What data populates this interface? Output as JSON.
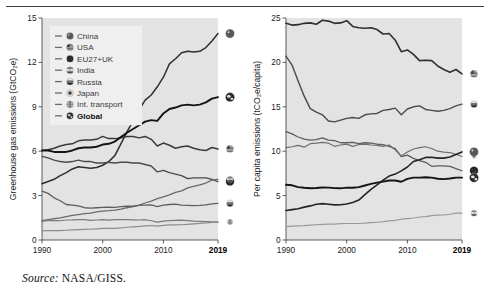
{
  "figure": {
    "source_prefix": "Source:",
    "source_text": "NASA/GISS."
  },
  "palette": {
    "plot_bg": "#e3e3e3",
    "legend_bg": "#efefef",
    "axis": "#4a4a4a",
    "line_dark": "#2f2f2f",
    "line_mid": "#5a5a5a",
    "line_light": "#8e8e8e",
    "global": "#1a1a1a"
  },
  "chart_data": [
    {
      "type": "line",
      "id": "left",
      "title": "",
      "ylabel": "Greenhouse gas emissions (GtCO₂e)",
      "xlabel": "",
      "xlim": [
        1990,
        2019
      ],
      "ylim": [
        0,
        15
      ],
      "yticks": [
        0,
        3,
        6,
        9,
        12,
        15
      ],
      "xticks": [
        1990,
        2000,
        2010,
        2019
      ],
      "xtick_labels": [
        "1990",
        "2000",
        "2010",
        "2019"
      ],
      "xtick_bold_last": true,
      "grid": false,
      "legend_position": "top-left",
      "x": [
        1990,
        1991,
        1992,
        1993,
        1994,
        1995,
        1996,
        1997,
        1998,
        1999,
        2000,
        2001,
        2002,
        2003,
        2004,
        2005,
        2006,
        2007,
        2008,
        2009,
        2010,
        2011,
        2012,
        2013,
        2014,
        2015,
        2016,
        2017,
        2018,
        2019
      ],
      "series": [
        {
          "name": "China",
          "marker": "china-flag-icon",
          "width": 1.5,
          "color": "#2f2f2f",
          "values": [
            3.8,
            3.95,
            4.1,
            4.35,
            4.55,
            4.8,
            4.95,
            4.9,
            4.85,
            4.9,
            5.05,
            5.3,
            5.7,
            6.5,
            7.3,
            8.05,
            8.8,
            9.45,
            9.8,
            10.35,
            11.0,
            11.9,
            12.25,
            12.65,
            12.75,
            12.7,
            12.75,
            13.0,
            13.45,
            13.95
          ]
        },
        {
          "name": "USA",
          "marker": "usa-flag-icon",
          "width": 1.5,
          "color": "#3a3a3a",
          "values": [
            6.05,
            6.1,
            6.2,
            6.35,
            6.45,
            6.5,
            6.7,
            6.75,
            6.75,
            6.8,
            7.0,
            6.85,
            6.85,
            6.9,
            7.0,
            7.0,
            6.9,
            7.0,
            6.8,
            6.35,
            6.55,
            6.4,
            6.2,
            6.3,
            6.35,
            6.2,
            6.1,
            6.05,
            6.25,
            6.15
          ]
        },
        {
          "name": "EU27+UK",
          "marker": "eu-flag-icon",
          "width": 1.4,
          "color": "#4a4a4a",
          "values": [
            5.65,
            5.55,
            5.4,
            5.3,
            5.25,
            5.3,
            5.4,
            5.3,
            5.3,
            5.2,
            5.2,
            5.25,
            5.2,
            5.25,
            5.25,
            5.2,
            5.2,
            5.1,
            5.0,
            4.6,
            4.7,
            4.55,
            4.45,
            4.35,
            4.15,
            4.2,
            4.2,
            4.2,
            4.1,
            3.95
          ]
        },
        {
          "name": "India",
          "marker": "india-flag-icon",
          "width": 1.3,
          "color": "#6a6a6a",
          "values": [
            1.3,
            1.38,
            1.45,
            1.5,
            1.58,
            1.66,
            1.72,
            1.78,
            1.82,
            1.9,
            1.95,
            1.98,
            2.02,
            2.08,
            2.18,
            2.26,
            2.36,
            2.5,
            2.62,
            2.8,
            2.92,
            3.05,
            3.22,
            3.32,
            3.52,
            3.62,
            3.72,
            3.85,
            4.05,
            4.1
          ]
        },
        {
          "name": "Russia",
          "marker": "russia-flag-icon",
          "width": 1.3,
          "color": "#5f5f5f",
          "values": [
            3.3,
            3.15,
            2.85,
            2.65,
            2.4,
            2.35,
            2.3,
            2.18,
            2.15,
            2.18,
            2.2,
            2.22,
            2.2,
            2.26,
            2.28,
            2.28,
            2.34,
            2.36,
            2.38,
            2.26,
            2.36,
            2.4,
            2.42,
            2.36,
            2.34,
            2.32,
            2.34,
            2.38,
            2.44,
            2.48
          ]
        },
        {
          "name": "Japan",
          "marker": "japan-flag-icon",
          "width": 1.2,
          "color": "#7a7a7a",
          "values": [
            1.28,
            1.3,
            1.32,
            1.3,
            1.35,
            1.36,
            1.38,
            1.37,
            1.33,
            1.35,
            1.37,
            1.34,
            1.37,
            1.38,
            1.37,
            1.36,
            1.35,
            1.37,
            1.3,
            1.21,
            1.27,
            1.31,
            1.33,
            1.34,
            1.31,
            1.27,
            1.26,
            1.25,
            1.22,
            1.19
          ]
        },
        {
          "name": "Int. transport",
          "marker": "transport-icon",
          "width": 1.2,
          "color": "#8c8c8c",
          "values": [
            0.62,
            0.63,
            0.64,
            0.64,
            0.66,
            0.68,
            0.7,
            0.72,
            0.73,
            0.75,
            0.78,
            0.78,
            0.79,
            0.82,
            0.86,
            0.89,
            0.92,
            0.96,
            0.98,
            0.94,
            0.99,
            1.02,
            1.02,
            1.03,
            1.06,
            1.09,
            1.12,
            1.16,
            1.19,
            1.22
          ]
        },
        {
          "name": "Global",
          "marker": "globe-icon",
          "width": 1.9,
          "color": "#141414",
          "values": [
            6.05,
            6.05,
            5.95,
            5.95,
            5.95,
            6.05,
            6.2,
            6.25,
            6.25,
            6.3,
            6.45,
            6.5,
            6.65,
            6.95,
            7.25,
            7.5,
            7.75,
            8.0,
            8.1,
            8.05,
            8.55,
            8.85,
            8.95,
            9.1,
            9.15,
            9.1,
            9.15,
            9.3,
            9.55,
            9.65
          ]
        }
      ]
    },
    {
      "type": "line",
      "id": "right",
      "title": "",
      "ylabel": "Per capita emissions (tCO₂e/capita)",
      "xlabel": "",
      "xlim": [
        1990,
        2019
      ],
      "ylim": [
        0,
        25
      ],
      "yticks": [
        0,
        5,
        10,
        15,
        20,
        25
      ],
      "xticks": [
        1990,
        2000,
        2010,
        2019
      ],
      "xtick_labels": [
        "1990",
        "2000",
        "2010",
        "2019"
      ],
      "xtick_bold_last": true,
      "grid": false,
      "legend_position": "none",
      "x": [
        1990,
        1991,
        1992,
        1993,
        1994,
        1995,
        1996,
        1997,
        1998,
        1999,
        2000,
        2001,
        2002,
        2003,
        2004,
        2005,
        2006,
        2007,
        2008,
        2009,
        2010,
        2011,
        2012,
        2013,
        2014,
        2015,
        2016,
        2017,
        2018,
        2019
      ],
      "series": [
        {
          "name": "USA",
          "marker": "usa-flag-icon",
          "width": 1.6,
          "color": "#2f2f2f",
          "values": [
            24.4,
            24.2,
            24.25,
            24.4,
            24.45,
            24.3,
            24.75,
            24.65,
            24.4,
            24.45,
            24.7,
            24.05,
            23.9,
            23.85,
            23.9,
            23.7,
            23.2,
            23.25,
            22.5,
            21.2,
            21.4,
            20.9,
            20.2,
            20.25,
            20.2,
            19.6,
            19.2,
            18.9,
            19.2,
            18.7
          ]
        },
        {
          "name": "Russia",
          "marker": "russia-flag-icon",
          "width": 1.4,
          "color": "#4a4a4a",
          "values": [
            20.7,
            19.7,
            17.9,
            16.2,
            14.8,
            14.4,
            14.1,
            13.4,
            13.3,
            13.5,
            13.7,
            13.8,
            13.7,
            14.1,
            14.2,
            14.25,
            14.6,
            14.7,
            14.85,
            14.1,
            14.75,
            15.0,
            15.1,
            14.7,
            14.6,
            14.5,
            14.6,
            14.8,
            15.1,
            15.3
          ]
        },
        {
          "name": "EU27+UK",
          "marker": "eu-flag-icon",
          "width": 1.3,
          "color": "#5c5c5c",
          "values": [
            12.2,
            11.95,
            11.6,
            11.35,
            11.25,
            11.3,
            11.5,
            11.25,
            11.2,
            10.95,
            10.95,
            11.0,
            10.85,
            10.95,
            10.9,
            10.8,
            10.75,
            10.55,
            10.3,
            9.4,
            9.55,
            9.2,
            8.95,
            8.75,
            8.3,
            8.35,
            8.35,
            8.3,
            8.05,
            7.8
          ]
        },
        {
          "name": "Japan",
          "marker": "japan-flag-icon",
          "width": 1.2,
          "color": "#6e6e6e",
          "values": [
            10.4,
            10.5,
            10.65,
            10.45,
            10.85,
            10.9,
            11.0,
            10.9,
            10.55,
            10.7,
            10.8,
            10.55,
            10.75,
            10.8,
            10.7,
            10.65,
            10.55,
            10.7,
            10.15,
            9.45,
            9.9,
            10.25,
            10.4,
            10.5,
            10.3,
            10.0,
            9.9,
            9.85,
            9.65,
            9.4
          ]
        },
        {
          "name": "China",
          "marker": "china-flag-icon",
          "width": 1.6,
          "color": "#242424",
          "values": [
            3.32,
            3.42,
            3.52,
            3.7,
            3.84,
            4.02,
            4.1,
            4.03,
            3.96,
            3.97,
            4.06,
            4.22,
            4.5,
            5.1,
            5.7,
            6.22,
            6.75,
            7.2,
            7.42,
            7.78,
            8.22,
            8.84,
            9.05,
            9.3,
            9.32,
            9.22,
            9.22,
            9.35,
            9.62,
            9.92
          ]
        },
        {
          "name": "Global",
          "marker": "globe-icon",
          "width": 1.9,
          "color": "#141414",
          "values": [
            6.22,
            6.16,
            5.96,
            5.88,
            5.82,
            5.86,
            5.92,
            5.9,
            5.84,
            5.82,
            5.9,
            5.88,
            5.96,
            6.14,
            6.32,
            6.46,
            6.58,
            6.7,
            6.7,
            6.56,
            6.88,
            7.02,
            7.02,
            7.06,
            7.02,
            6.9,
            6.86,
            6.92,
            7.02,
            7.02
          ]
        },
        {
          "name": "India",
          "marker": "india-flag-icon",
          "width": 1.2,
          "color": "#9a9a9a",
          "values": [
            1.5,
            1.56,
            1.6,
            1.62,
            1.68,
            1.72,
            1.75,
            1.78,
            1.79,
            1.84,
            1.86,
            1.86,
            1.86,
            1.89,
            1.95,
            2.0,
            2.06,
            2.15,
            2.22,
            2.34,
            2.41,
            2.48,
            2.59,
            2.63,
            2.75,
            2.8,
            2.84,
            2.9,
            3.02,
            3.02
          ]
        }
      ]
    }
  ],
  "legend": {
    "items": [
      {
        "label": "China",
        "marker": "china-flag-icon",
        "bold": false
      },
      {
        "label": "USA",
        "marker": "usa-flag-icon",
        "bold": false
      },
      {
        "label": "EU27+UK",
        "marker": "eu-flag-icon",
        "bold": false
      },
      {
        "label": "India",
        "marker": "india-flag-icon",
        "bold": false
      },
      {
        "label": "Russia",
        "marker": "russia-flag-icon",
        "bold": false
      },
      {
        "label": "Japan",
        "marker": "japan-flag-icon",
        "bold": false
      },
      {
        "label": "Int. transport",
        "marker": "transport-icon",
        "bold": false
      },
      {
        "label": "Global",
        "marker": "globe-icon",
        "bold": true
      }
    ]
  }
}
